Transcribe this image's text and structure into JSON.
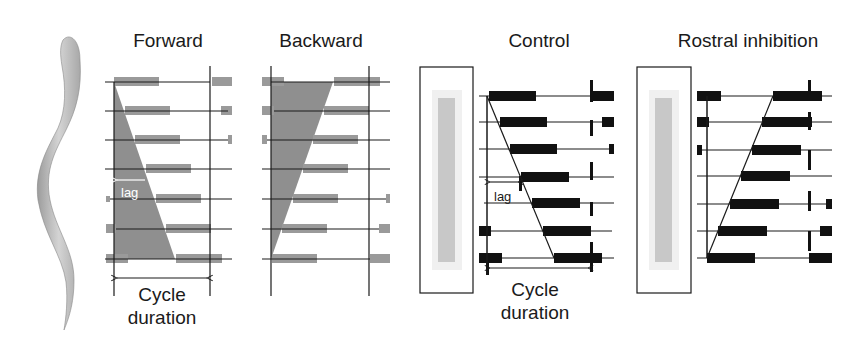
{
  "panels": {
    "forward": {
      "title": "Forward",
      "lag_label": "lag",
      "caption_line1": "Cycle",
      "caption_line2": "duration"
    },
    "backward": {
      "title": "Backward"
    },
    "control": {
      "title": "Control",
      "lag_label": "lag",
      "caption_line1": "Cycle",
      "caption_line2": "duration"
    },
    "rostral": {
      "title": "Rostral inhibition"
    }
  },
  "colors": {
    "gray_bar": "#9a9a9a",
    "gray_wedge": "#8f8f8f",
    "black_bar": "#111111",
    "line": "#1a1a1a",
    "spinal_cord_fill": "#c8c8c8"
  }
}
